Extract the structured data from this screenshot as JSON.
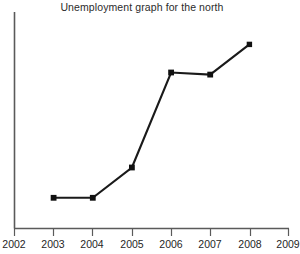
{
  "chart_data": {
    "type": "line",
    "title": "Unemployment graph for the north",
    "xlabel": "",
    "ylabel": "",
    "grid": false,
    "legend": false,
    "marker": "square",
    "line_color": "#1a1a1a",
    "marker_color": "#111111",
    "axis_color": "#5a5a5a",
    "background_color": "#ffffff",
    "xlim": [
      2002,
      2009
    ],
    "ylim": [
      0,
      100
    ],
    "y_axis_labels_shown": false,
    "x_ticks": [
      2002,
      2003,
      2004,
      2005,
      2006,
      2007,
      2008,
      2009
    ],
    "x_tick_labels": [
      "2002",
      "2003",
      "2004",
      "2005",
      "2006",
      "2007",
      "2008",
      "2009"
    ],
    "x": [
      2003,
      2004,
      2005,
      2006,
      2007,
      2008
    ],
    "values": [
      14,
      14,
      28,
      72,
      71,
      85
    ],
    "points": [
      {
        "x": 2003,
        "y": 14
      },
      {
        "x": 2004,
        "y": 14
      },
      {
        "x": 2005,
        "y": 28
      },
      {
        "x": 2006,
        "y": 72
      },
      {
        "x": 2007,
        "y": 71
      },
      {
        "x": 2008,
        "y": 85
      }
    ],
    "series": [
      {
        "name": "Unemployment",
        "values": [
          14,
          14,
          28,
          72,
          71,
          85
        ]
      }
    ]
  },
  "axis": {
    "tick_labels": {
      "t0": "2002",
      "t1": "2003",
      "t2": "2004",
      "t3": "2005",
      "t4": "2006",
      "t5": "2007",
      "t6": "2008",
      "t7": "2009"
    }
  },
  "header": {
    "title": "Unemployment graph for the north"
  }
}
